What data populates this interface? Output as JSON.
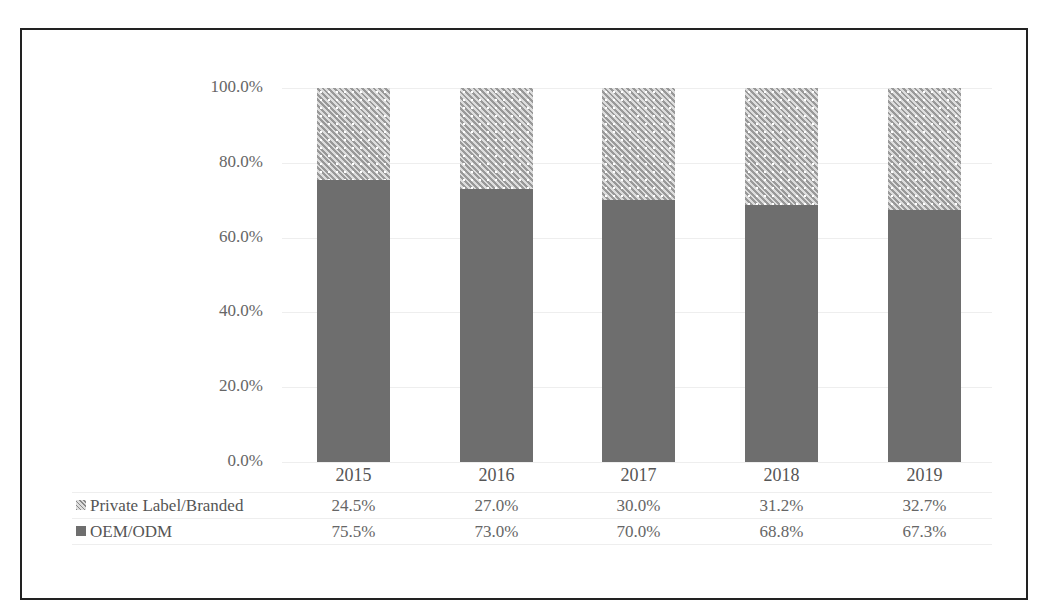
{
  "caption": "图表：市场份额",
  "chart_data": {
    "type": "bar",
    "stacked": true,
    "categories": [
      "2015",
      "2016",
      "2017",
      "2018",
      "2019"
    ],
    "series": [
      {
        "name": "OEM/ODM",
        "values": [
          75.5,
          73.0,
          70.0,
          68.8,
          67.3
        ],
        "labels": [
          "75.5%",
          "73.0%",
          "70.0%",
          "68.8%",
          "67.3%"
        ],
        "color": "#6e6e6e"
      },
      {
        "name": "Private Label/Branded",
        "values": [
          24.5,
          27.0,
          30.0,
          31.2,
          32.7
        ],
        "labels": [
          "24.5%",
          "27.0%",
          "30.0%",
          "31.2%",
          "32.7%"
        ],
        "pattern": "hatched"
      }
    ],
    "yticks": [
      "0.0%",
      "20.0%",
      "40.0%",
      "60.0%",
      "80.0%",
      "100.0%"
    ],
    "ylim": [
      0,
      100
    ],
    "title": "",
    "xlabel": "",
    "ylabel": "",
    "legend_position": "data-table-below",
    "grid": true
  }
}
